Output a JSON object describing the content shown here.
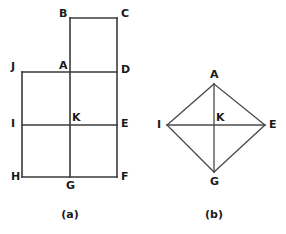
{
  "figure": {
    "background_color": "#ffffff",
    "line_color": "#3a3a3a",
    "label_color": "#1a1a1a",
    "captions": {
      "left": "(a)",
      "right": "(b)"
    },
    "panel_a": {
      "caption": "(a)",
      "description": "Rectangular grid figure composed of an upper square and a lower rectangle divided into four cells",
      "vertices": [
        {
          "id": "B",
          "label": "B",
          "x": 70,
          "y": 18,
          "label_x": 59,
          "label_y": 17
        },
        {
          "id": "C",
          "label": "C",
          "x": 117,
          "y": 18,
          "label_x": 121,
          "label_y": 17
        },
        {
          "id": "A",
          "label": "A",
          "x": 70,
          "y": 72,
          "label_x": 59,
          "label_y": 69
        },
        {
          "id": "D",
          "label": "D",
          "x": 117,
          "y": 72,
          "label_x": 121,
          "label_y": 73
        },
        {
          "id": "J",
          "label": "J",
          "x": 22,
          "y": 72,
          "label_x": 11,
          "label_y": 70
        },
        {
          "id": "I",
          "label": "I",
          "x": 22,
          "y": 125,
          "label_x": 11,
          "label_y": 127
        },
        {
          "id": "K",
          "label": "K",
          "x": 70,
          "y": 125,
          "label_x": 72,
          "label_y": 121
        },
        {
          "id": "E",
          "label": "E",
          "x": 117,
          "y": 125,
          "label_x": 121,
          "label_y": 127
        },
        {
          "id": "H",
          "label": "H",
          "x": 22,
          "y": 177,
          "label_x": 11,
          "label_y": 180
        },
        {
          "id": "G",
          "label": "G",
          "x": 70,
          "y": 177,
          "label_x": 66,
          "label_y": 189
        },
        {
          "id": "F",
          "label": "F",
          "x": 117,
          "y": 177,
          "label_x": 121,
          "label_y": 180
        }
      ],
      "edges": [
        {
          "name": "B-C",
          "x1": 70,
          "y1": 18,
          "x2": 117,
          "y2": 18
        },
        {
          "name": "C-F",
          "x1": 117,
          "y1": 18,
          "x2": 117,
          "y2": 177
        },
        {
          "name": "B-G",
          "x1": 70,
          "y1": 18,
          "x2": 70,
          "y2": 177
        },
        {
          "name": "J-D",
          "x1": 22,
          "y1": 72,
          "x2": 117,
          "y2": 72
        },
        {
          "name": "J-H",
          "x1": 22,
          "y1": 72,
          "x2": 22,
          "y2": 177
        },
        {
          "name": "I-E",
          "x1": 22,
          "y1": 125,
          "x2": 117,
          "y2": 125
        },
        {
          "name": "H-F",
          "x1": 22,
          "y1": 177,
          "x2": 117,
          "y2": 177
        }
      ]
    },
    "panel_b": {
      "caption": "(b)",
      "description": "Rhombus with vertices A top, E right, G bottom, I left, and diagonals crossing at center K",
      "vertices": [
        {
          "id": "A",
          "label": "A",
          "x": 214,
          "y": 84,
          "label_x": 210,
          "label_y": 78
        },
        {
          "id": "I",
          "label": "I",
          "x": 167,
          "y": 125,
          "label_x": 157,
          "label_y": 128
        },
        {
          "id": "K",
          "label": "K",
          "x": 214,
          "y": 125,
          "label_x": 216,
          "label_y": 121
        },
        {
          "id": "E",
          "label": "E",
          "x": 265,
          "y": 125,
          "label_x": 269,
          "label_y": 128
        },
        {
          "id": "G",
          "label": "G",
          "x": 214,
          "y": 172,
          "label_x": 210,
          "label_y": 185
        }
      ],
      "edges": [
        {
          "name": "A-I",
          "x1": 214,
          "y1": 84,
          "x2": 167,
          "y2": 125
        },
        {
          "name": "A-E",
          "x1": 214,
          "y1": 84,
          "x2": 265,
          "y2": 125
        },
        {
          "name": "I-G",
          "x1": 167,
          "y1": 125,
          "x2": 214,
          "y2": 172
        },
        {
          "name": "E-G",
          "x1": 265,
          "y1": 125,
          "x2": 214,
          "y2": 172
        },
        {
          "name": "I-E-diagonal",
          "x1": 167,
          "y1": 125,
          "x2": 265,
          "y2": 125
        },
        {
          "name": "A-G-diagonal",
          "x1": 214,
          "y1": 84,
          "x2": 214,
          "y2": 172
        }
      ]
    }
  }
}
